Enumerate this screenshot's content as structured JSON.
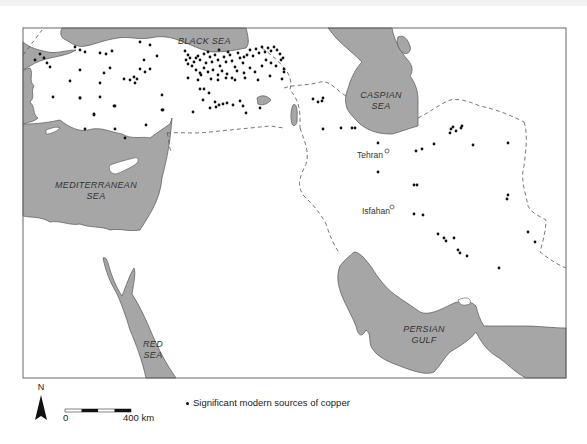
{
  "map": {
    "type": "thematic-point-map",
    "region": "Near East / Middle East",
    "colors": {
      "water": "#a6a6a6",
      "land": "#ffffff",
      "coast": "#555555",
      "dots": "#111111",
      "frame": "#666666"
    },
    "seas": [
      {
        "id": "black-sea",
        "line1": "BLACK  SEA",
        "line2": ""
      },
      {
        "id": "caspian-sea",
        "line1": "CASPIAN",
        "line2": "SEA"
      },
      {
        "id": "mediterranean-sea",
        "line1": "MEDITERRANEAN",
        "line2": "SEA"
      },
      {
        "id": "red-sea",
        "line1": "RED",
        "line2": "SEA"
      },
      {
        "id": "persian-gulf",
        "line1": "PERSIAN",
        "line2": "GULF"
      }
    ],
    "cities": [
      {
        "name": "Tehran",
        "x": 384,
        "y": 152
      },
      {
        "name": "Isfahan",
        "x": 391,
        "y": 208
      }
    ],
    "copper_sources": [
      [
        35,
        60
      ],
      [
        40,
        54
      ],
      [
        44,
        58
      ],
      [
        50,
        67
      ],
      [
        47,
        63
      ],
      [
        75,
        47
      ],
      [
        80,
        50
      ],
      [
        85,
        52
      ],
      [
        100,
        53
      ],
      [
        106,
        54
      ],
      [
        112,
        51
      ],
      [
        140,
        42
      ],
      [
        150,
        45
      ],
      [
        110,
        68
      ],
      [
        104,
        73
      ],
      [
        80,
        70
      ],
      [
        70,
        81
      ],
      [
        100,
        83
      ],
      [
        100,
        97
      ],
      [
        53,
        97
      ],
      [
        80,
        98
      ],
      [
        80,
        98
      ],
      [
        94,
        115
      ],
      [
        115,
        106
      ],
      [
        114,
        106
      ],
      [
        130,
        80
      ],
      [
        134,
        77
      ],
      [
        140,
        69
      ],
      [
        145,
        72
      ],
      [
        150,
        69
      ],
      [
        157,
        56
      ],
      [
        144,
        60
      ],
      [
        124,
        79
      ],
      [
        135,
        83
      ],
      [
        137,
        79
      ],
      [
        162,
        95
      ],
      [
        163,
        110
      ],
      [
        146,
        125
      ],
      [
        162,
        110
      ],
      [
        85,
        129
      ],
      [
        115,
        129
      ],
      [
        125,
        138
      ],
      [
        94,
        114
      ],
      [
        185,
        51
      ],
      [
        188,
        55
      ],
      [
        190,
        58
      ],
      [
        194,
        62
      ],
      [
        198,
        56
      ],
      [
        200,
        60
      ],
      [
        204,
        54
      ],
      [
        206,
        63
      ],
      [
        210,
        57
      ],
      [
        212,
        62
      ],
      [
        215,
        55
      ],
      [
        218,
        60
      ],
      [
        220,
        66
      ],
      [
        224,
        57
      ],
      [
        226,
        62
      ],
      [
        230,
        55
      ],
      [
        232,
        61
      ],
      [
        235,
        67
      ],
      [
        240,
        58
      ],
      [
        243,
        63
      ],
      [
        247,
        55
      ],
      [
        250,
        50
      ],
      [
        253,
        56
      ],
      [
        256,
        49
      ],
      [
        259,
        53
      ],
      [
        262,
        47
      ],
      [
        265,
        52
      ],
      [
        268,
        48
      ],
      [
        271,
        51
      ],
      [
        274,
        47
      ],
      [
        277,
        50
      ],
      [
        280,
        54
      ],
      [
        283,
        58
      ],
      [
        186,
        60
      ],
      [
        192,
        66
      ],
      [
        196,
        70
      ],
      [
        200,
        73
      ],
      [
        204,
        68
      ],
      [
        208,
        72
      ],
      [
        213,
        70
      ],
      [
        218,
        75
      ],
      [
        222,
        71
      ],
      [
        227,
        74
      ],
      [
        232,
        78
      ],
      [
        237,
        71
      ],
      [
        244,
        73
      ],
      [
        250,
        68
      ],
      [
        255,
        72
      ],
      [
        262,
        66
      ],
      [
        266,
        60
      ],
      [
        271,
        63
      ],
      [
        276,
        66
      ],
      [
        281,
        60
      ],
      [
        284,
        69
      ],
      [
        188,
        78
      ],
      [
        198,
        80
      ],
      [
        201,
        75
      ],
      [
        211,
        79
      ],
      [
        218,
        80
      ],
      [
        226,
        78
      ],
      [
        235,
        80
      ],
      [
        245,
        78
      ],
      [
        258,
        80
      ],
      [
        270,
        76
      ],
      [
        200,
        89
      ],
      [
        204,
        89
      ],
      [
        209,
        93
      ],
      [
        215,
        102
      ],
      [
        210,
        108
      ],
      [
        203,
        100
      ],
      [
        216,
        107
      ],
      [
        219,
        105
      ],
      [
        223,
        104
      ],
      [
        227,
        103
      ],
      [
        233,
        105
      ],
      [
        240,
        101
      ],
      [
        243,
        106
      ],
      [
        246,
        113
      ],
      [
        193,
        112
      ],
      [
        260,
        108
      ],
      [
        282,
        79
      ],
      [
        284,
        72
      ],
      [
        188,
        64
      ],
      [
        196,
        58
      ],
      [
        208,
        52
      ],
      [
        219,
        50
      ],
      [
        228,
        52
      ],
      [
        238,
        53
      ],
      [
        244,
        57
      ],
      [
        313,
        99
      ],
      [
        318,
        102
      ],
      [
        322,
        101
      ],
      [
        323,
        98
      ],
      [
        323,
        129
      ],
      [
        341,
        128
      ],
      [
        352,
        128
      ],
      [
        355,
        128
      ],
      [
        378,
        143
      ],
      [
        378,
        172
      ],
      [
        416,
        151
      ],
      [
        422,
        149
      ],
      [
        434,
        144
      ],
      [
        451,
        129
      ],
      [
        450,
        133
      ],
      [
        453,
        127
      ],
      [
        456,
        131
      ],
      [
        461,
        128
      ],
      [
        462,
        126
      ],
      [
        473,
        145
      ],
      [
        508,
        143
      ],
      [
        414,
        185
      ],
      [
        417,
        185
      ],
      [
        507,
        199
      ],
      [
        508,
        195
      ],
      [
        414,
        214
      ],
      [
        423,
        215
      ],
      [
        438,
        234
      ],
      [
        444,
        238
      ],
      [
        446,
        241
      ],
      [
        454,
        238
      ],
      [
        458,
        250
      ],
      [
        460,
        253
      ],
      [
        467,
        256
      ],
      [
        499,
        268
      ],
      [
        528,
        232
      ],
      [
        535,
        242
      ]
    ],
    "scale": {
      "zero_label": "0",
      "end_label": "400 km"
    },
    "north_label": "N",
    "legend": {
      "text": "Significant modern sources of copper"
    }
  }
}
